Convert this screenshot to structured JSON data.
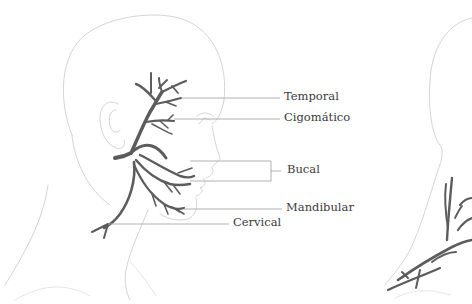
{
  "diagram": {
    "colors": {
      "background": "#ffffff",
      "outline": "#cfcfcf",
      "nerve": "#5c5c5c",
      "leader_line": "#a8a8a8",
      "label_text": "#3a3a3a"
    },
    "labels": [
      {
        "id": "temporal",
        "text": "Temporal"
      },
      {
        "id": "zygomatic",
        "text": "Cigomático"
      },
      {
        "id": "buccal",
        "text": "Bucal"
      },
      {
        "id": "mandibular",
        "text": "Mandibular"
      },
      {
        "id": "cervical",
        "text": "Cervical"
      }
    ]
  }
}
